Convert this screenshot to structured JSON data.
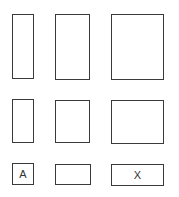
{
  "diagram": {
    "stroke_color": "#3a3a3a",
    "background": "#ffffff",
    "rows": [
      {
        "name": "row-1",
        "shapes": [
          {
            "id": "r1c1",
            "x": 12,
            "y": 14,
            "w": 22,
            "h": 65,
            "label": ""
          },
          {
            "id": "r1c2",
            "x": 55,
            "y": 14,
            "w": 35,
            "h": 66,
            "label": ""
          },
          {
            "id": "r1c3",
            "x": 111,
            "y": 14,
            "w": 53,
            "h": 66,
            "label": ""
          }
        ]
      },
      {
        "name": "row-2",
        "shapes": [
          {
            "id": "r2c1",
            "x": 12,
            "y": 99,
            "w": 22,
            "h": 44,
            "label": ""
          },
          {
            "id": "r2c2",
            "x": 55,
            "y": 100,
            "w": 35,
            "h": 43,
            "label": ""
          },
          {
            "id": "r2c3",
            "x": 111,
            "y": 100,
            "w": 53,
            "h": 44,
            "label": ""
          }
        ]
      },
      {
        "name": "row-3",
        "shapes": [
          {
            "id": "r3c1",
            "x": 12,
            "y": 163,
            "w": 22,
            "h": 22,
            "label": "A"
          },
          {
            "id": "r3c2",
            "x": 55,
            "y": 164,
            "w": 36,
            "h": 21,
            "label": ""
          },
          {
            "id": "r3c3",
            "x": 111,
            "y": 164,
            "w": 53,
            "h": 22,
            "label": "X"
          }
        ]
      }
    ]
  }
}
